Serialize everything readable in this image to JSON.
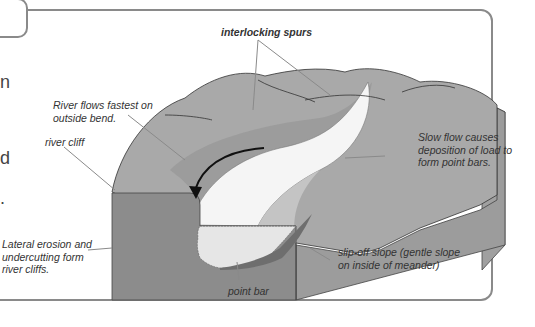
{
  "title": {
    "visible_fragment": "s"
  },
  "body_text_fragments": [
    "n",
    "d",
    "."
  ],
  "diagram": {
    "labels": {
      "interlocking_spurs": "interlocking spurs",
      "river_flows_fastest": [
        "River flows fastest on",
        "outside bend."
      ],
      "river_cliff": "river cliff",
      "lateral_erosion": [
        "Lateral erosion and",
        "undercutting form",
        "river cliffs."
      ],
      "slow_flow": [
        "Slow flow causes",
        "deposition of load to",
        "form point bars."
      ],
      "slip_off_slope": [
        "slip-off slope (gentle slope",
        "on inside of meander)"
      ],
      "point_bar": "point bar"
    },
    "colors": {
      "frame": "#8a8a8a",
      "land_top": "#a9a9a9",
      "land_side": "#8c8c8c",
      "land_right_side": "#9c9c9c",
      "river": "#f4f4f4",
      "point_bar": "#c4c4c4",
      "slip_off": "#6e6e6e",
      "leader": "#8a8a8a"
    }
  }
}
